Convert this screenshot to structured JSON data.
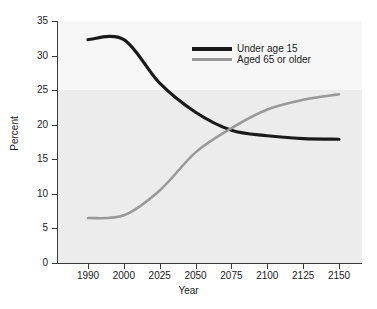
{
  "chart_data": {
    "type": "line",
    "title": "",
    "xlabel": "Year",
    "ylabel": "Percent",
    "categories": [
      "1990",
      "2000",
      "2025",
      "2050",
      "2075",
      "2100",
      "2125",
      "2150"
    ],
    "ylim": [
      0,
      35
    ],
    "yticks": [
      "0",
      "5",
      "10",
      "15",
      "20",
      "25",
      "30",
      "35"
    ],
    "grid": false,
    "legend_position": "upper-center-right",
    "series": [
      {
        "name": "Under age 15",
        "color": "#1a1a1a",
        "values": [
          32.3,
          32.3,
          26.0,
          21.8,
          19.2,
          18.4,
          18.0,
          17.9
        ]
      },
      {
        "name": "Aged 65 or older",
        "color": "#999999",
        "values": [
          6.5,
          6.9,
          10.5,
          16.0,
          19.5,
          22.2,
          23.6,
          24.4
        ]
      }
    ],
    "annotations": []
  },
  "legend": {
    "items": [
      {
        "label": "Under age 15",
        "color": "#1a1a1a"
      },
      {
        "label": "Aged 65 or older",
        "color": "#999999"
      }
    ]
  },
  "axes": {
    "x_title": "Year",
    "y_title": "Percent"
  }
}
